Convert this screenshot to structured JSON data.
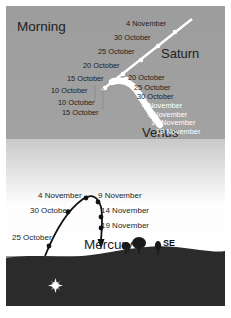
{
  "figure": {
    "caption_region": "sky-chart",
    "sky_label": "Morning",
    "compass_label": "SE",
    "colors": {
      "sky_top": "#9d9d9d",
      "sky_bottom": "#ffffff",
      "ground": "#2b2b2b",
      "saturn_track": "#ffffff",
      "venus_track": "#ffffff",
      "mercury_track": "#111111",
      "label_dark": "#1d1d1d",
      "label_white": "#ffffff"
    }
  },
  "planets": {
    "saturn": {
      "name": "Saturn",
      "track_type": "line",
      "labels": [
        "4 November",
        "30 October",
        "25 October",
        "20 October",
        "15 October",
        "10 October"
      ]
    },
    "venus": {
      "name": "Venus",
      "track_type": "curve",
      "labels_right": [
        "20 October",
        "25 October",
        "30 October",
        "4 November",
        "9 November",
        "14 November",
        "19 November"
      ],
      "labels_left": [
        "10 October",
        "15 October"
      ]
    },
    "mercury": {
      "name": "Mercury",
      "track_type": "arc",
      "labels_left": [
        "4 November",
        "30 October",
        "25 October"
      ],
      "labels_right": [
        "9 November",
        "14 November",
        "19 November"
      ]
    }
  },
  "scenery": {
    "sun_icon": "sun-starburst",
    "trees": [
      "tree-small",
      "tree-large",
      "tree-thin"
    ]
  }
}
